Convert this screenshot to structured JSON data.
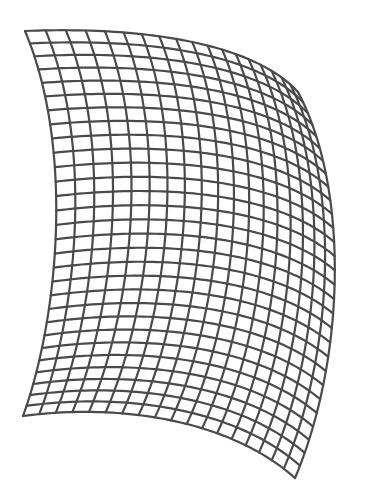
{
  "diagram": {
    "type": "warped-grid-mesh",
    "width": 369,
    "height": 499,
    "background": "#ffffff",
    "line_color": "#4a4a4a",
    "line_width": 2.2,
    "columns": 18,
    "rows": 29,
    "boundary": {
      "top": [
        [
          25,
          31
        ],
        [
          150,
          26
        ],
        [
          255,
          45
        ],
        [
          298,
          92
        ]
      ],
      "bottom": [
        [
          23,
          416
        ],
        [
          120,
          403
        ],
        [
          230,
          420
        ],
        [
          295,
          478
        ]
      ],
      "left": [
        [
          25,
          31
        ],
        [
          75,
          150
        ],
        [
          58,
          320
        ],
        [
          23,
          416
        ]
      ],
      "right": [
        [
          298,
          92
        ],
        [
          350,
          190
        ],
        [
          345,
          360
        ],
        [
          295,
          478
        ]
      ]
    }
  }
}
